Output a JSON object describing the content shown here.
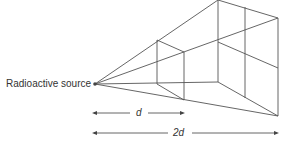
{
  "diagram": {
    "type": "inverse-square-law",
    "source_label": "Radioactive source",
    "distance_near_label": "d",
    "distance_far_label": "2d",
    "line_color": "#555555",
    "near_square": {
      "top_left": [
        157,
        40
      ],
      "top_right": [
        184,
        52
      ],
      "bottom_left": [
        157,
        84
      ],
      "bottom_right": [
        184,
        100
      ]
    },
    "far_square": {
      "top_left": [
        218,
        0
      ],
      "top_right": [
        278,
        18
      ],
      "bottom_left": [
        218,
        82
      ],
      "bottom_right": [
        278,
        116
      ]
    },
    "source_point": [
      95,
      84
    ]
  }
}
